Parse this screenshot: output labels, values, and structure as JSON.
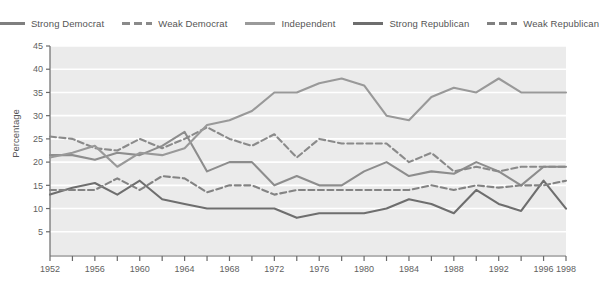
{
  "legend": {
    "position": "top-center",
    "items": [
      {
        "label": "Strong Democrat",
        "style": "solid",
        "color": "#7f7f7f",
        "icon": "line-solid-icon"
      },
      {
        "label": "Weak Democrat",
        "style": "dashed",
        "color": "#8a8a8a",
        "icon": "line-dashed-icon"
      },
      {
        "label": "Independent",
        "style": "solid",
        "color": "#9a9a9a",
        "icon": "line-solid-icon"
      },
      {
        "label": "Strong Republican",
        "style": "solid",
        "color": "#6e6e6e",
        "icon": "line-solid-icon"
      },
      {
        "label": "Weak Republican",
        "style": "dashed",
        "color": "#808080",
        "icon": "line-dashed-icon"
      }
    ]
  },
  "axis": {
    "y_title": "Percentage",
    "y_ticks": [
      5,
      10,
      15,
      20,
      25,
      30,
      35,
      40,
      45
    ],
    "x_tick_years": [
      1952,
      1954,
      1956,
      1958,
      1960,
      1962,
      1964,
      1966,
      1968,
      1970,
      1972,
      1974,
      1976,
      1978,
      1980,
      1982,
      1984,
      1986,
      1988,
      1990,
      1992,
      1994,
      1996,
      1998
    ],
    "x_tick_labels": [
      "1952",
      "",
      "1956",
      "",
      "1960",
      "",
      "1964",
      "",
      "1968",
      "",
      "1972",
      "",
      "1976",
      "",
      "1980",
      "",
      "1984",
      "",
      "1988",
      "",
      "1992",
      "",
      "1996",
      "1998"
    ]
  },
  "chart_data": {
    "type": "line",
    "title": "",
    "xlabel": "",
    "ylabel": "Percentage",
    "xlim": [
      1952,
      1998
    ],
    "ylim": [
      0,
      45
    ],
    "grid": "horizontal",
    "x": [
      1952,
      1954,
      1956,
      1958,
      1960,
      1962,
      1964,
      1966,
      1968,
      1970,
      1972,
      1974,
      1976,
      1978,
      1980,
      1982,
      1984,
      1986,
      1988,
      1990,
      1992,
      1994,
      1996,
      1998
    ],
    "series": [
      {
        "name": "Strong Democrat",
        "style": "solid",
        "color": "#8d8d8d",
        "values": [
          21.5,
          21.5,
          20.5,
          22.0,
          21.5,
          23.5,
          26.5,
          18.0,
          20.0,
          20.0,
          15.0,
          17.0,
          15.0,
          15.0,
          18.0,
          20.0,
          17.0,
          18.0,
          17.5,
          20.0,
          18.0,
          15.0,
          19.0,
          19.0
        ]
      },
      {
        "name": "Weak Democrat",
        "style": "dashed",
        "color": "#8a8a8a",
        "values": [
          25.5,
          25.0,
          23.0,
          22.5,
          25.0,
          23.0,
          25.0,
          27.5,
          25.0,
          23.5,
          26.0,
          21.0,
          25.0,
          24.0,
          24.0,
          24.0,
          20.0,
          22.0,
          18.0,
          19.0,
          18.0,
          19.0,
          19.0,
          19.0
        ]
      },
      {
        "name": "Independent",
        "style": "solid",
        "color": "#999999",
        "values": [
          21.0,
          22.0,
          23.5,
          19.0,
          22.0,
          21.5,
          23.0,
          28.0,
          29.0,
          31.0,
          35.0,
          35.0,
          37.0,
          38.0,
          36.5,
          30.0,
          29.0,
          34.0,
          36.0,
          35.0,
          38.0,
          35.0,
          35.0,
          35.0
        ]
      },
      {
        "name": "Strong Republican",
        "style": "solid",
        "color": "#6e6e6e",
        "values": [
          13.0,
          14.5,
          15.5,
          13.0,
          16.0,
          12.0,
          11.0,
          10.0,
          10.0,
          10.0,
          10.0,
          8.0,
          9.0,
          9.0,
          9.0,
          10.0,
          12.0,
          11.0,
          9.0,
          14.0,
          11.0,
          9.5,
          16.0,
          10.0
        ]
      },
      {
        "name": "Weak Republican",
        "style": "dashed",
        "color": "#838383",
        "values": [
          14.0,
          14.0,
          14.0,
          16.5,
          14.0,
          17.0,
          16.5,
          13.5,
          15.0,
          15.0,
          13.0,
          14.0,
          14.0,
          14.0,
          14.0,
          14.0,
          14.0,
          15.0,
          14.0,
          15.0,
          14.5,
          15.0,
          15.0,
          16.0
        ]
      }
    ]
  }
}
